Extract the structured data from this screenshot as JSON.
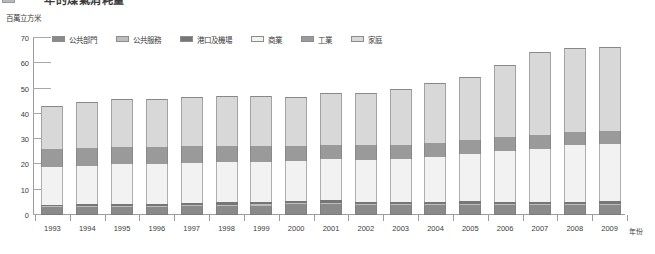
{
  "title": {
    "clipped_text": "年的煤氣消耗量",
    "note_visible": "partially-cropped-title-row"
  },
  "axis": {
    "y_unit_label": "百萬立方米",
    "x_title": "年份",
    "y_ticks": [
      0,
      10,
      20,
      30,
      40,
      50,
      60,
      70
    ],
    "y_min": 0,
    "y_max": 70
  },
  "legend": {
    "items": [
      {
        "label": "公共部門",
        "color": "#8a8a8a"
      },
      {
        "label": "公共服務",
        "color": "#bdbdbd"
      },
      {
        "label": "港口及機場",
        "color": "#767676"
      },
      {
        "label": "商業",
        "color": "#f2f2f2"
      },
      {
        "label": "工業",
        "color": "#9a9a9a"
      },
      {
        "label": "家庭",
        "color": "#d8d8d8"
      }
    ]
  },
  "chart_data": {
    "type": "bar",
    "title": "年的煤氣消耗量",
    "xlabel": "年份",
    "ylabel": "百萬立方米",
    "ylim": [
      0,
      70
    ],
    "grid": true,
    "legend_position": "top",
    "stacked": true,
    "categories": [
      "1993",
      "1994",
      "1995",
      "1996",
      "1997",
      "1998",
      "1999",
      "2000",
      "2001",
      "2002",
      "2003",
      "2004",
      "2005",
      "2006",
      "2007",
      "2008",
      "2009"
    ],
    "series": [
      {
        "name": "公共部門",
        "color": "#8a8a8a",
        "values": [
          3.0,
          3.2,
          3.3,
          3.3,
          3.5,
          3.6,
          3.7,
          4.2,
          4.4,
          3.8,
          3.9,
          3.9,
          4.0,
          3.9,
          3.9,
          3.9,
          4.0
        ]
      },
      {
        "name": "公共服務",
        "color": "#bdbdbd",
        "values": [
          0.4,
          0.4,
          0.4,
          0.4,
          0.4,
          0.5,
          0.5,
          0.5,
          0.5,
          0.5,
          0.5,
          0.5,
          0.5,
          0.5,
          0.5,
          0.5,
          0.5
        ]
      },
      {
        "name": "港口及機場",
        "color": "#767676",
        "values": [
          0.7,
          0.7,
          0.8,
          0.8,
          0.9,
          0.9,
          1.0,
          1.0,
          1.0,
          0.9,
          0.9,
          0.9,
          0.9,
          0.9,
          0.9,
          0.9,
          0.9
        ]
      },
      {
        "name": "商業",
        "color": "#f2f2f2",
        "values": [
          14.9,
          15.0,
          15.5,
          15.7,
          15.7,
          15.9,
          15.8,
          15.7,
          16.1,
          16.5,
          16.9,
          17.7,
          18.6,
          19.9,
          21.0,
          22.2,
          22.6
        ]
      },
      {
        "name": "工業",
        "color": "#9a9a9a",
        "values": [
          7.0,
          7.2,
          6.9,
          6.8,
          6.8,
          6.5,
          6.3,
          5.8,
          5.8,
          5.8,
          5.6,
          5.6,
          5.6,
          5.5,
          5.5,
          5.4,
          5.4
        ]
      },
      {
        "name": "家庭",
        "color": "#d8d8d8",
        "values": [
          17.2,
          18.3,
          19.1,
          19.0,
          19.4,
          19.8,
          19.8,
          19.6,
          20.5,
          20.9,
          21.9,
          23.6,
          24.9,
          28.6,
          32.7,
          33.3,
          32.9
        ]
      }
    ],
    "totals": [
      43.2,
      44.8,
      46.0,
      46.0,
      46.7,
      47.2,
      47.1,
      46.8,
      48.3,
      48.4,
      49.7,
      52.2,
      54.5,
      59.3,
      64.5,
      66.2,
      66.3
    ]
  }
}
